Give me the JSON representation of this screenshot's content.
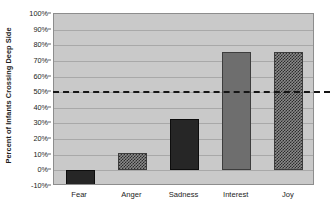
{
  "chart_data": {
    "type": "bar",
    "title": "",
    "xlabel": "",
    "ylabel": "Percent of Infants Crossing Deep Side",
    "categories": [
      "Fear",
      "Anger",
      "Sadness",
      "Interest",
      "Joy"
    ],
    "values": [
      -10,
      11,
      33,
      76,
      76
    ],
    "value_labels": [
      "-10%",
      "11%",
      "33%",
      "76%",
      "76%"
    ],
    "bar_styles": [
      "solid-dark",
      "checker",
      "solid-dark",
      "solid-mid",
      "checker"
    ],
    "ylim": [
      -10,
      100
    ],
    "ytick_values": [
      100,
      90,
      80,
      70,
      60,
      50,
      40,
      30,
      20,
      10,
      0,
      -10
    ],
    "ytick_labels": [
      "100%",
      "90%",
      "80%",
      "70%",
      "60%",
      "50%",
      "40%",
      "30%",
      "20%",
      "10%",
      "0%",
      "-10%"
    ],
    "grid": true,
    "legend": "none",
    "annotations": [
      {
        "name": "chance-level-reference-line",
        "type": "horizontal-dashed-line",
        "value": 50,
        "label": "50%"
      }
    ],
    "plot_background": "#c9c9c9",
    "gridline_color": "#a8a8a8",
    "reference_line_color": "#151515"
  }
}
